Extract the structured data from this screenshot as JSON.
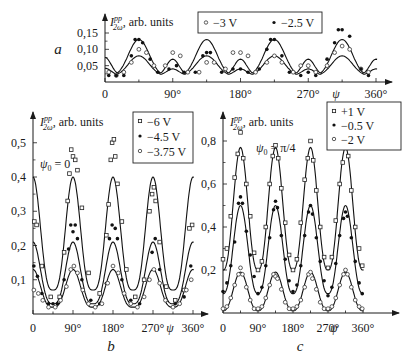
{
  "chart_data": [
    {
      "panel": "a",
      "type": "line",
      "panel_label": "a",
      "ylabel": "I_{2ω}^{pp}, arb. units",
      "xlabel": "ψ",
      "x_ticks": [
        "0",
        "90°",
        "180°",
        "270°",
        "360°"
      ],
      "y_ticks": [
        "0,05",
        "0,10",
        "0,15"
      ],
      "xlim": [
        0,
        360
      ],
      "ylim": [
        0,
        0.18
      ],
      "legend": [
        {
          "label": "−3 V",
          "marker": "open-circle"
        },
        {
          "label": "−2.5 V",
          "marker": "filled-circle"
        }
      ],
      "fit_curves": [
        {
          "name": "−2.5 V fit",
          "peaks_45_135_225_315": 0.13,
          "peaks_90_180_270": 0.07,
          "minimum": 0.02
        },
        {
          "name": "−3 V fit",
          "peaks_45_135_225_315": 0.08,
          "peaks_90_180_270": 0.04,
          "minimum": 0.02
        }
      ],
      "series": [
        {
          "name": "−3 V",
          "x": [
            5,
            15,
            25,
            35,
            45,
            55,
            65,
            80,
            90,
            100,
            110,
            125,
            135,
            145,
            160,
            170,
            180,
            190,
            200,
            215,
            225,
            235,
            250,
            260,
            270,
            280,
            295,
            305,
            315,
            325,
            340,
            350
          ],
          "y": [
            0.03,
            0.02,
            0.03,
            0.06,
            0.1,
            0.09,
            0.05,
            0.05,
            0.09,
            0.08,
            0.03,
            0.03,
            0.06,
            0.06,
            0.04,
            0.09,
            0.09,
            0.08,
            0.03,
            0.06,
            0.08,
            0.06,
            0.03,
            0.05,
            0.05,
            0.03,
            0.05,
            0.09,
            0.11,
            0.1,
            0.04,
            0.03
          ]
        },
        {
          "name": "−2.5 V",
          "x": [
            5,
            15,
            25,
            35,
            40,
            45,
            50,
            60,
            70,
            85,
            95,
            105,
            120,
            130,
            135,
            140,
            155,
            170,
            180,
            190,
            205,
            215,
            220,
            225,
            235,
            245,
            260,
            270,
            280,
            295,
            305,
            310,
            315,
            325,
            340,
            350
          ],
          "y": [
            0.02,
            0.02,
            0.02,
            0.08,
            0.13,
            0.13,
            0.12,
            0.07,
            0.03,
            0.04,
            0.05,
            0.03,
            0.03,
            0.08,
            0.09,
            0.09,
            0.03,
            0.04,
            0.04,
            0.03,
            0.04,
            0.1,
            0.13,
            0.13,
            0.08,
            0.03,
            0.02,
            0.03,
            0.02,
            0.07,
            0.12,
            0.16,
            0.16,
            0.14,
            0.04,
            0.02
          ]
        }
      ]
    },
    {
      "panel": "b",
      "type": "line",
      "panel_label": "b",
      "ylabel": "I_{2ω}^{pp}, arb. units",
      "xlabel": "ψ",
      "annotation": "ψ0 = 0",
      "x_ticks": [
        "0",
        "90°",
        "180°",
        "270°",
        "360°"
      ],
      "y_ticks": [
        "0,1",
        "0,2",
        "0,3",
        "0,4",
        "0,5"
      ],
      "xlim": [
        0,
        360
      ],
      "ylim": [
        0,
        0.55
      ],
      "legend": [
        {
          "label": "−6 V",
          "marker": "open-square"
        },
        {
          "label": "−4.5 V",
          "marker": "filled-circle"
        },
        {
          "label": "−3.75 V",
          "marker": "open-circle"
        }
      ],
      "fit_curves": [
        {
          "name": "−6 V fit",
          "peak": 0.4,
          "minimum": 0.07,
          "peak_positions": [
            0,
            90,
            180,
            270,
            360
          ]
        },
        {
          "name": "−4.5 V fit",
          "peak": 0.21,
          "minimum": 0.03,
          "peak_positions": [
            0,
            90,
            180,
            270,
            360
          ]
        },
        {
          "name": "−3.75 V fit",
          "peak": 0.13,
          "minimum": 0.02,
          "peak_positions": [
            0,
            90,
            180,
            270,
            360
          ]
        }
      ],
      "series": [
        {
          "name": "−6 V",
          "x": [
            3,
            8,
            20,
            40,
            60,
            70,
            78,
            82,
            86,
            90,
            95,
            100,
            110,
            125,
            150,
            165,
            170,
            175,
            178,
            182,
            185,
            190,
            200,
            210,
            230,
            250,
            262,
            268,
            272,
            276,
            285,
            300,
            320,
            340,
            352,
            358
          ],
          "y": [
            0.27,
            0.26,
            0.14,
            0.05,
            0.05,
            0.18,
            0.33,
            0.41,
            0.48,
            0.46,
            0.45,
            0.42,
            0.31,
            0.12,
            0.06,
            0.23,
            0.32,
            0.45,
            0.5,
            0.51,
            0.46,
            0.38,
            0.27,
            0.13,
            0.05,
            0.1,
            0.3,
            0.35,
            0.37,
            0.33,
            0.21,
            0.08,
            0.04,
            0.07,
            0.25,
            0.26
          ]
        },
        {
          "name": "−4.5 V",
          "x": [
            2,
            10,
            20,
            35,
            45,
            55,
            70,
            80,
            85,
            90,
            95,
            100,
            110,
            130,
            150,
            165,
            172,
            178,
            185,
            190,
            200,
            220,
            240,
            260,
            268,
            275,
            285,
            300,
            320,
            340,
            355
          ],
          "y": [
            0.14,
            0.11,
            0.06,
            0.03,
            0.03,
            0.03,
            0.1,
            0.19,
            0.26,
            0.24,
            0.26,
            0.22,
            0.1,
            0.04,
            0.03,
            0.09,
            0.22,
            0.26,
            0.25,
            0.22,
            0.1,
            0.04,
            0.03,
            0.1,
            0.18,
            0.22,
            0.13,
            0.04,
            0.03,
            0.05,
            0.14
          ]
        },
        {
          "name": "−3.75 V",
          "x": [
            2,
            12,
            22,
            35,
            50,
            62,
            75,
            85,
            92,
            100,
            112,
            125,
            140,
            155,
            168,
            180,
            192,
            205,
            220,
            235,
            250,
            262,
            272,
            285,
            298,
            315,
            330,
            345,
            356
          ],
          "y": [
            0.07,
            0.06,
            0.04,
            0.02,
            0.02,
            0.04,
            0.08,
            0.13,
            0.14,
            0.12,
            0.07,
            0.03,
            0.02,
            0.03,
            0.09,
            0.14,
            0.12,
            0.06,
            0.03,
            0.02,
            0.05,
            0.1,
            0.13,
            0.09,
            0.04,
            0.02,
            0.03,
            0.07,
            0.1
          ]
        }
      ]
    },
    {
      "panel": "c",
      "type": "line",
      "panel_label": "c",
      "ylabel": "I_{2ω}^{pp}, arb. units",
      "xlabel": "ψ",
      "annotation": "ψ0 = π/4",
      "x_ticks": [
        "0",
        "90°",
        "180°",
        "270°",
        "360°"
      ],
      "y_ticks": [
        "0,2",
        "0,4",
        "0,6",
        "0,8"
      ],
      "xlim": [
        0,
        360
      ],
      "ylim": [
        0,
        0.88
      ],
      "legend": [
        {
          "label": "+1 V",
          "marker": "open-square"
        },
        {
          "label": "−0.5 V",
          "marker": "filled-circle"
        },
        {
          "label": "−2 V",
          "marker": "open-circle"
        }
      ],
      "fit_curves": [
        {
          "name": "+1 V fit",
          "peak": 0.77,
          "minimum": 0.2,
          "peak_positions": [
            45,
            135,
            225,
            315
          ]
        },
        {
          "name": "−0.5 V fit",
          "peak": 0.5,
          "minimum": 0.09,
          "peak_positions": [
            45,
            135,
            225,
            315
          ]
        },
        {
          "name": "−2 V fit",
          "peak": 0.19,
          "minimum": 0.01,
          "peak_positions": [
            45,
            135,
            225,
            315
          ]
        }
      ],
      "series": [
        {
          "name": "+1 V",
          "x": [
            0,
            10,
            20,
            30,
            38,
            45,
            52,
            60,
            70,
            80,
            90,
            100,
            110,
            120,
            128,
            135,
            142,
            150,
            160,
            170,
            180,
            190,
            200,
            210,
            218,
            225,
            232,
            240,
            250,
            260,
            270,
            280,
            290,
            300,
            308,
            315,
            322,
            330,
            340,
            350,
            358
          ],
          "y": [
            0.25,
            0.3,
            0.45,
            0.63,
            0.74,
            0.84,
            0.72,
            0.6,
            0.45,
            0.28,
            0.2,
            0.24,
            0.4,
            0.6,
            0.73,
            0.78,
            0.72,
            0.58,
            0.42,
            0.27,
            0.2,
            0.25,
            0.42,
            0.62,
            0.72,
            0.8,
            0.71,
            0.57,
            0.4,
            0.26,
            0.21,
            0.26,
            0.43,
            0.6,
            0.7,
            0.78,
            0.73,
            0.57,
            0.4,
            0.3,
            0.22
          ]
        },
        {
          "name": "−0.5 V",
          "x": [
            0,
            10,
            20,
            30,
            40,
            45,
            50,
            60,
            70,
            80,
            90,
            100,
            110,
            120,
            130,
            135,
            140,
            150,
            160,
            170,
            180,
            190,
            200,
            210,
            220,
            225,
            230,
            240,
            250,
            260,
            270,
            280,
            290,
            300,
            310,
            315,
            320,
            330,
            340,
            350,
            358
          ],
          "y": [
            0.1,
            0.14,
            0.22,
            0.33,
            0.51,
            0.54,
            0.51,
            0.38,
            0.27,
            0.17,
            0.09,
            0.12,
            0.22,
            0.35,
            0.48,
            0.52,
            0.49,
            0.36,
            0.25,
            0.15,
            0.1,
            0.13,
            0.22,
            0.36,
            0.47,
            0.5,
            0.46,
            0.35,
            0.24,
            0.15,
            0.08,
            0.12,
            0.23,
            0.36,
            0.44,
            0.47,
            0.45,
            0.35,
            0.24,
            0.14,
            0.09
          ]
        },
        {
          "name": "−2 V",
          "x": [
            0,
            10,
            20,
            30,
            40,
            45,
            50,
            60,
            70,
            80,
            90,
            100,
            110,
            120,
            130,
            135,
            140,
            150,
            160,
            170,
            180,
            190,
            200,
            210,
            220,
            225,
            230,
            240,
            250,
            260,
            270,
            280,
            290,
            300,
            310,
            315,
            320,
            330,
            340,
            350,
            358
          ],
          "y": [
            0.02,
            0.03,
            0.07,
            0.13,
            0.18,
            0.21,
            0.18,
            0.12,
            0.06,
            0.02,
            0.02,
            0.03,
            0.07,
            0.13,
            0.18,
            0.17,
            0.16,
            0.11,
            0.05,
            0.02,
            0.02,
            0.03,
            0.06,
            0.12,
            0.18,
            0.19,
            0.16,
            0.11,
            0.05,
            0.02,
            0.02,
            0.03,
            0.07,
            0.13,
            0.18,
            0.2,
            0.18,
            0.12,
            0.06,
            0.03,
            0.02
          ]
        }
      ]
    }
  ]
}
